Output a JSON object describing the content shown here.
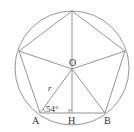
{
  "diagram": {
    "type": "regular pentagon inscribed in circle",
    "colors": {
      "stroke": "#888888",
      "text": "#333333"
    },
    "labels": {
      "center": "O",
      "vertex_a": "A",
      "vertex_b": "B",
      "foot": "H",
      "radius": "r",
      "angle": "54°"
    }
  }
}
